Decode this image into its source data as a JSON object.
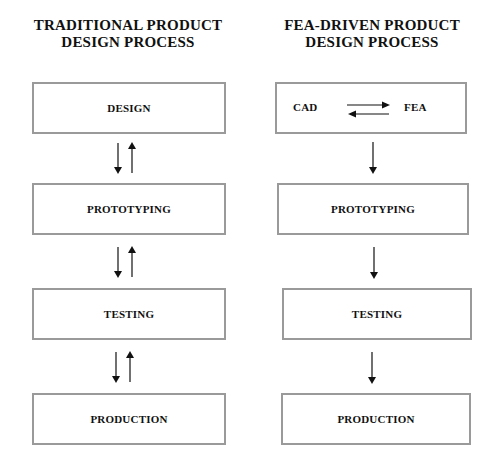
{
  "left": {
    "title_line1": "TRADITIONAL PRODUCT",
    "title_line2": "DESIGN PROCESS",
    "steps": [
      "DESIGN",
      "PROTOTYPING",
      "TESTING",
      "PRODUCTION"
    ],
    "connectors": "bidirectional"
  },
  "right": {
    "title_line1": "FEA-DRIVEN PRODUCT",
    "title_line2": "DESIGN PROCESS",
    "first_box": {
      "left_label": "CAD",
      "right_label": "FEA",
      "connector": "bidirectional"
    },
    "steps": [
      "PROTOTYPING",
      "TESTING",
      "PRODUCTION"
    ],
    "connectors": "downward"
  },
  "colors": {
    "box_border": "#9a9a9a",
    "text": "#111111",
    "arrow": "#111111"
  }
}
